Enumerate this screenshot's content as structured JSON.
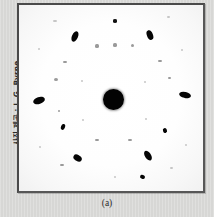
{
  "figure": {
    "caption": "(a)",
    "photo_credit": "사진 제공 : J. G. Byrne",
    "background_color": "#d9d9d7",
    "plate_background_color": "#fdfdfd",
    "frame_color": "#4a4a4a",
    "spot_color": "#050505"
  },
  "chart_data": {
    "type": "scatter",
    "title": "",
    "subtitle": "",
    "xlabel": "",
    "ylabel": "",
    "xlim": [
      0,
      188
    ],
    "ylim": [
      0,
      190
    ],
    "grid": false,
    "legend": null,
    "annotations": [
      "(a)",
      "사진 제공 : J. G. Byrne"
    ],
    "center_beam": {
      "x": 94,
      "y": 94,
      "r": 10.5
    },
    "points": [
      {
        "x": 20,
        "y": 95,
        "rx": 6.0,
        "ry": 3.4,
        "rot": -18,
        "class": "spot"
      },
      {
        "x": 166,
        "y": 90,
        "rx": 6.2,
        "ry": 3.2,
        "rot": 12,
        "class": "spot"
      },
      {
        "x": 56,
        "y": 31,
        "rx": 3.0,
        "ry": 5.4,
        "rot": 24,
        "class": "spot"
      },
      {
        "x": 131,
        "y": 30,
        "rx": 3.0,
        "ry": 5.2,
        "rot": -22,
        "class": "spot"
      },
      {
        "x": 58,
        "y": 153,
        "rx": 4.4,
        "ry": 3.2,
        "rot": 32,
        "class": "spot"
      },
      {
        "x": 129,
        "y": 151,
        "rx": 3.2,
        "ry": 5.6,
        "rot": -32,
        "class": "spot"
      },
      {
        "x": 44,
        "y": 122,
        "rx": 2.2,
        "ry": 3.0,
        "rot": 20,
        "class": "spot"
      },
      {
        "x": 146,
        "y": 126,
        "rx": 2.0,
        "ry": 2.6,
        "rot": -20,
        "class": "spot"
      },
      {
        "x": 124,
        "y": 172,
        "rx": 2.6,
        "ry": 2.0,
        "rot": 18,
        "class": "spot"
      },
      {
        "x": 96,
        "y": 16,
        "rx": 2.4,
        "ry": 1.6,
        "rot": 0,
        "class": "soft"
      },
      {
        "x": 78,
        "y": 41,
        "rx": 1.6,
        "ry": 1.6,
        "rot": 0,
        "class": "faint"
      },
      {
        "x": 96,
        "y": 40,
        "rx": 1.6,
        "ry": 1.6,
        "rot": 0,
        "class": "faint"
      },
      {
        "x": 113,
        "y": 40,
        "rx": 1.5,
        "ry": 1.5,
        "rot": 0,
        "class": "faint"
      },
      {
        "x": 46,
        "y": 57,
        "rx": 1.6,
        "ry": 1.4,
        "rot": 0,
        "class": "faint"
      },
      {
        "x": 141,
        "y": 56,
        "rx": 1.6,
        "ry": 1.4,
        "rot": 0,
        "class": "faint"
      },
      {
        "x": 37,
        "y": 74,
        "rx": 1.8,
        "ry": 1.5,
        "rot": 0,
        "class": "faint"
      },
      {
        "x": 150,
        "y": 73,
        "rx": 1.5,
        "ry": 1.4,
        "rot": 0,
        "class": "faint"
      },
      {
        "x": 40,
        "y": 106,
        "rx": 1.4,
        "ry": 1.4,
        "rot": 0,
        "class": "faint"
      },
      {
        "x": 36,
        "y": 16,
        "rx": 1.6,
        "ry": 1.4,
        "rot": 0,
        "class": "vfaint"
      },
      {
        "x": 149,
        "y": 12,
        "rx": 1.5,
        "ry": 1.4,
        "rot": 0,
        "class": "vfaint"
      },
      {
        "x": 78,
        "y": 135,
        "rx": 1.6,
        "ry": 1.4,
        "rot": 0,
        "class": "faint"
      },
      {
        "x": 111,
        "y": 135,
        "rx": 1.6,
        "ry": 1.4,
        "rot": 0,
        "class": "faint"
      },
      {
        "x": 43,
        "y": 160,
        "rx": 1.6,
        "ry": 1.4,
        "rot": 0,
        "class": "faint"
      },
      {
        "x": 152,
        "y": 163,
        "rx": 1.5,
        "ry": 1.4,
        "rot": 0,
        "class": "vfaint"
      },
      {
        "x": 96,
        "y": 172,
        "rx": 1.4,
        "ry": 1.4,
        "rot": 0,
        "class": "vfaint"
      },
      {
        "x": 20,
        "y": 44,
        "rx": 1.4,
        "ry": 1.3,
        "rot": 0,
        "class": "vfaint"
      },
      {
        "x": 163,
        "y": 45,
        "rx": 1.3,
        "ry": 1.3,
        "rot": 0,
        "class": "vfaint"
      },
      {
        "x": 21,
        "y": 142,
        "rx": 1.3,
        "ry": 1.3,
        "rot": 0,
        "class": "vfaint"
      },
      {
        "x": 167,
        "y": 140,
        "rx": 1.3,
        "ry": 1.3,
        "rot": 0,
        "class": "vfaint"
      },
      {
        "x": 63,
        "y": 76,
        "rx": 1.2,
        "ry": 1.2,
        "rot": 0,
        "class": "vfaint"
      },
      {
        "x": 126,
        "y": 77,
        "rx": 1.2,
        "ry": 1.2,
        "rot": 0,
        "class": "vfaint"
      },
      {
        "x": 64,
        "y": 115,
        "rx": 1.2,
        "ry": 1.2,
        "rot": 0,
        "class": "vfaint"
      },
      {
        "x": 127,
        "y": 114,
        "rx": 1.2,
        "ry": 1.2,
        "rot": 0,
        "class": "vfaint"
      }
    ]
  }
}
